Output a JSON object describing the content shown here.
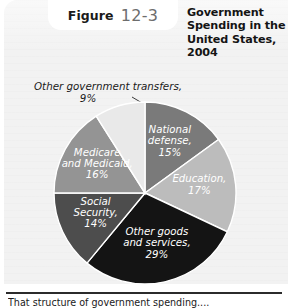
{
  "figure": {
    "label_word": "Figure",
    "number": "12-3",
    "title": "Government Spending in the United States, 2004",
    "title_lines": [
      "Government",
      "Spending in the",
      "United States,",
      "2004"
    ],
    "caption": "That structure of government spending....",
    "panel_bg": "#f2f2f2",
    "badge_bg": "#ffffff",
    "number_color": "#6d6d6d",
    "rule_color": "#2b2b2b"
  },
  "callout": {
    "text": "Other government transfers,",
    "percent": "9%"
  },
  "chart_data": {
    "type": "pie",
    "title": "Government Spending in the United States, 2004",
    "units": "percent of total government spending",
    "legend": "none (labels placed on slices)",
    "start_angle_deg": -90,
    "direction": "clockwise",
    "categories": [
      "National defense",
      "Education",
      "Other goods and services",
      "Social Security",
      "Medicare and Medicaid",
      "Other government transfers"
    ],
    "values": [
      15,
      17,
      29,
      14,
      16,
      9
    ],
    "labels": [
      "National defense, 15%",
      "Education, 17%",
      "Other goods and services, 29%",
      "Social Security, 14%",
      "Medicare and Medicaid, 16%",
      "Other government transfers, 9%"
    ],
    "colors": [
      "#7a7a7a",
      "#bcbcbc",
      "#141414",
      "#4d4d4d",
      "#949494",
      "#e9e9e9"
    ],
    "slices": [
      {
        "name": "National defense",
        "value": 15,
        "color": "#7a7a7a",
        "label_lines": [
          "National",
          "defense,",
          "15%"
        ],
        "label_fill": "light",
        "placed_on_slice": true
      },
      {
        "name": "Education",
        "value": 17,
        "color": "#bcbcbc",
        "label_lines": [
          "Education,",
          "17%"
        ],
        "label_fill": "light",
        "placed_on_slice": true
      },
      {
        "name": "Other goods and services",
        "value": 29,
        "color": "#141414",
        "label_lines": [
          "Other goods",
          "and services,",
          "29%"
        ],
        "label_fill": "light",
        "placed_on_slice": true
      },
      {
        "name": "Social Security",
        "value": 14,
        "color": "#4d4d4d",
        "label_lines": [
          "Social",
          "Security,",
          "14%"
        ],
        "label_fill": "light",
        "placed_on_slice": true
      },
      {
        "name": "Medicare and Medicaid",
        "value": 16,
        "color": "#949494",
        "label_lines": [
          "Medicare",
          "and Medicaid,",
          "16%"
        ],
        "label_fill": "light",
        "placed_on_slice": true
      },
      {
        "name": "Other government transfers",
        "value": 9,
        "color": "#e9e9e9",
        "label_lines": [
          "Other government transfers,",
          "9%"
        ],
        "label_fill": "dark",
        "placed_on_slice": false,
        "leader_line": true
      }
    ]
  }
}
